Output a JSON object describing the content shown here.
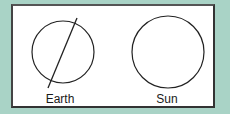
{
  "diagram": {
    "background_color": "#a9d3c6",
    "panel_color": "#ffffff",
    "objects": [
      {
        "name": "earth",
        "label": "Earth",
        "shape": "circle",
        "has_axis_line": true
      },
      {
        "name": "sun",
        "label": "Sun",
        "shape": "circle",
        "has_axis_line": false
      }
    ]
  }
}
